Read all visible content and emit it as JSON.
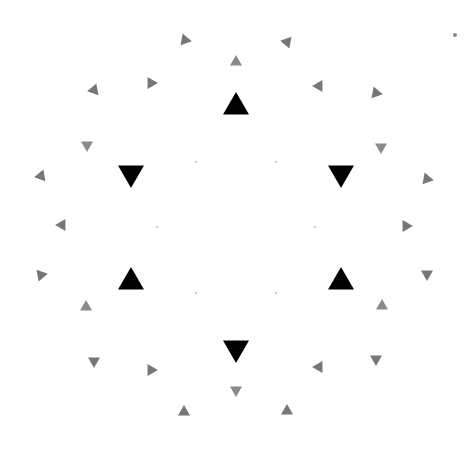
{
  "figure": {
    "width": 476,
    "height": 452,
    "background": "#ffffff",
    "center": [
      236,
      226
    ],
    "colors": {
      "large": "#000000",
      "small": "#777777",
      "small_light": "#8a8a8a",
      "dot": "#888888"
    },
    "large_triangles": [
      {
        "x": 236,
        "y": 107,
        "dir": "up",
        "size": 26
      },
      {
        "x": 131,
        "y": 173,
        "dir": "down",
        "size": 26
      },
      {
        "x": 341,
        "y": 173,
        "dir": "down",
        "size": 26
      },
      {
        "x": 131,
        "y": 282,
        "dir": "up",
        "size": 26
      },
      {
        "x": 341,
        "y": 282,
        "dir": "up",
        "size": 26
      },
      {
        "x": 236,
        "y": 348,
        "dir": "down",
        "size": 26
      }
    ],
    "small_triangles": [
      {
        "x": 185,
        "y": 40,
        "rot": 100,
        "tone": "small"
      },
      {
        "x": 236,
        "y": 62,
        "rot": 0,
        "tone": "small_light"
      },
      {
        "x": 287,
        "y": 42,
        "rot": -80,
        "tone": "small"
      },
      {
        "x": 94,
        "y": 90,
        "rot": 140,
        "tone": "small"
      },
      {
        "x": 151,
        "y": 83,
        "rot": 90,
        "tone": "small"
      },
      {
        "x": 319,
        "y": 86,
        "rot": -90,
        "tone": "small"
      },
      {
        "x": 376,
        "y": 93,
        "rot": -140,
        "tone": "small"
      },
      {
        "x": 87,
        "y": 145,
        "rot": 180,
        "tone": "small_light"
      },
      {
        "x": 381,
        "y": 147,
        "rot": 180,
        "tone": "small_light"
      },
      {
        "x": 41,
        "y": 176,
        "rot": -100,
        "tone": "small"
      },
      {
        "x": 427,
        "y": 179,
        "rot": 100,
        "tone": "small"
      },
      {
        "x": 62,
        "y": 225,
        "rot": -90,
        "tone": "small"
      },
      {
        "x": 406,
        "y": 226,
        "rot": 90,
        "tone": "small"
      },
      {
        "x": 41,
        "y": 275,
        "rot": -40,
        "tone": "small"
      },
      {
        "x": 427,
        "y": 274,
        "rot": 60,
        "tone": "small"
      },
      {
        "x": 86,
        "y": 307,
        "rot": 0,
        "tone": "small_light"
      },
      {
        "x": 382,
        "y": 306,
        "rot": 0,
        "tone": "small_light"
      },
      {
        "x": 94,
        "y": 361,
        "rot": 60,
        "tone": "small"
      },
      {
        "x": 151,
        "y": 370,
        "rot": 90,
        "tone": "small"
      },
      {
        "x": 319,
        "y": 367,
        "rot": -90,
        "tone": "small"
      },
      {
        "x": 376,
        "y": 359,
        "rot": -60,
        "tone": "small"
      },
      {
        "x": 236,
        "y": 390,
        "rot": 180,
        "tone": "small_light"
      },
      {
        "x": 184,
        "y": 412,
        "rot": 120,
        "tone": "small"
      },
      {
        "x": 287,
        "y": 411,
        "rot": -120,
        "tone": "small"
      }
    ],
    "dots": [
      {
        "x": 196,
        "y": 162,
        "r": 0.8
      },
      {
        "x": 276,
        "y": 162,
        "r": 0.8
      },
      {
        "x": 157,
        "y": 227,
        "r": 0.8
      },
      {
        "x": 315,
        "y": 227,
        "r": 0.8
      },
      {
        "x": 196,
        "y": 293,
        "r": 0.8
      },
      {
        "x": 276,
        "y": 293,
        "r": 0.8
      },
      {
        "x": 455,
        "y": 35,
        "r": 2
      }
    ]
  }
}
